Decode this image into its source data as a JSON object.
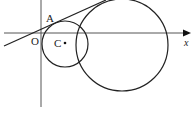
{
  "diagram": {
    "labels": {
      "point_a": "A",
      "origin": "O",
      "center": "C",
      "x_axis": "x"
    },
    "colors": {
      "stroke": "#222222",
      "axis": "#555555",
      "background": "#ffffff"
    },
    "elements": {
      "x_axis": {
        "x1": 4,
        "y1": 33,
        "x2": 186,
        "y2": 33
      },
      "y_axis": {
        "x1": 41,
        "y1": 0,
        "x2": 41,
        "y2": 107
      },
      "small_circle": {
        "cx": 65,
        "cy": 44,
        "r": 23
      },
      "large_circle": {
        "cx": 122,
        "cy": 45,
        "r": 46
      },
      "tangent_line": {
        "x1": 4,
        "y1": 46,
        "x2": 106,
        "y2": 0
      }
    }
  }
}
